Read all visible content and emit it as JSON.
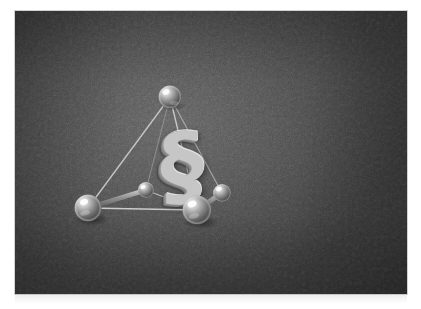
{
  "page": {
    "background_color": "#ffffff",
    "photo": {
      "x": 15,
      "y": 11,
      "width": 392,
      "height": 283,
      "background_color": "#454545",
      "description_alt": "Dark grey studio backdrop with a metallic tetrahedral molecule model and a silver section sign",
      "grain": "film-grain-texture"
    }
  },
  "scene": {
    "type": "3d-molecule-render",
    "backdrop": {
      "center_color": "#5d5d5d",
      "edge_color": "#373737",
      "highlight_position": "upper-left-of-center"
    },
    "center_glyph": {
      "character": "§",
      "name": "section-sign",
      "color": "#c6c6c6",
      "shadow_color": "#7c7c7c",
      "x": 167,
      "y": 155,
      "rotation_deg": -5
    },
    "atoms": [
      {
        "id": "atom-top",
        "label": "top apex sphere",
        "cx": 170,
        "cy": 97,
        "r": 11.5,
        "color": "#b9b9b9"
      },
      {
        "id": "atom-left",
        "label": "lower left sphere",
        "cx": 88,
        "cy": 208,
        "r": 13.5,
        "color": "#bdbdbd"
      },
      {
        "id": "atom-right",
        "label": "lower right large sphere",
        "cx": 197,
        "cy": 210,
        "r": 14.5,
        "color": "#c2c2c2"
      },
      {
        "id": "atom-center-small",
        "label": "small center sphere",
        "cx": 146,
        "cy": 190,
        "r": 8.0,
        "color": "#b5b5b5"
      },
      {
        "id": "atom-satellite",
        "label": "small right satellite",
        "cx": 222,
        "cy": 193,
        "r": 9.0,
        "color": "#bababa"
      }
    ],
    "bonds": [
      {
        "from": "atom-top",
        "to": "atom-left",
        "style": "thin",
        "color": "#c9c9c9"
      },
      {
        "from": "atom-top",
        "to": "atom-right",
        "style": "thin",
        "color": "#cccccc"
      },
      {
        "from": "atom-top",
        "to": "atom-center-small",
        "style": "thin",
        "color": "#b0b0b0"
      },
      {
        "from": "atom-top",
        "to": "atom-satellite",
        "style": "thin",
        "color": "#bdbdbd"
      },
      {
        "from": "atom-left",
        "to": "atom-right",
        "style": "thin",
        "color": "#d2d2d2"
      },
      {
        "from": "atom-left",
        "to": "atom-center-small",
        "style": "thick",
        "color": "#8e8e8e"
      },
      {
        "from": "atom-right",
        "to": "atom-center-small",
        "style": "thin",
        "color": "#c6c6c6"
      },
      {
        "from": "atom-right",
        "to": "atom-satellite",
        "style": "thick",
        "color": "#8b8b8b"
      }
    ]
  }
}
